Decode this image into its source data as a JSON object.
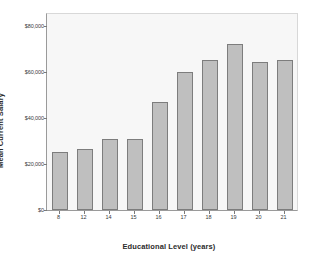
{
  "chart_data": {
    "type": "bar",
    "title": "",
    "xlabel": "Educational Level (years)",
    "ylabel": "Mean Current Salary",
    "categories": [
      "8",
      "12",
      "14",
      "15",
      "16",
      "17",
      "18",
      "19",
      "20",
      "21"
    ],
    "values": [
      25000,
      26500,
      31000,
      31000,
      47000,
      60000,
      65000,
      72000,
      64000,
      65000
    ],
    "ylim": [
      0,
      85000
    ],
    "y_ticks": [
      0,
      20000,
      40000,
      60000,
      80000
    ],
    "y_tick_labels": [
      "$0",
      "$20,000",
      "$40,000",
      "$60,000",
      "$80,000"
    ],
    "grid": false,
    "legend": null,
    "bar_fill_color": "#bfbfbf",
    "bar_border_color": "#7d7d7d",
    "plot_background_color": "#f7f7f7",
    "axis_color": "#9a9a9a",
    "text_color": "#2b2b2b"
  }
}
